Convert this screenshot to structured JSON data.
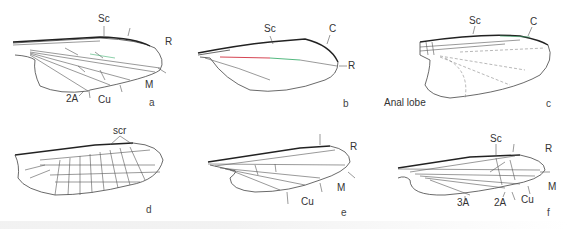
{
  "figure": {
    "panels": [
      {
        "id": "a",
        "letter": "a",
        "labels": [
          "Sc",
          "R",
          "M",
          "Cu",
          "2A"
        ]
      },
      {
        "id": "b",
        "letter": "b",
        "labels": [
          "Sc",
          "C",
          "R"
        ]
      },
      {
        "id": "c",
        "letter": "c",
        "labels": [
          "Sc",
          "C",
          "Anal lobe"
        ]
      },
      {
        "id": "d",
        "letter": "d",
        "labels": [
          "scr"
        ]
      },
      {
        "id": "e",
        "letter": "e",
        "labels": [
          "R",
          "M",
          "Cu"
        ]
      },
      {
        "id": "f",
        "letter": "f",
        "labels": [
          "Sc",
          "R",
          "M",
          "Cu",
          "2A",
          "3A"
        ]
      }
    ],
    "colors": {
      "red_vein": "#d03040",
      "green_vein": "#40b070",
      "outline": "#333333"
    }
  }
}
